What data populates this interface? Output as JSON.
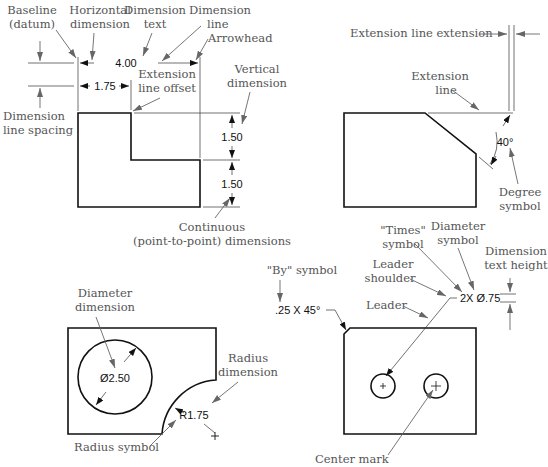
{
  "figure": {
    "panel_tl": {
      "labels": {
        "baseline": [
          "Baseline",
          "(datum)"
        ],
        "horizontal_dimension": [
          "Horizontal",
          "dimension"
        ],
        "dimension_text": [
          "Dimension",
          "text"
        ],
        "dimension_line": [
          "Dimension",
          "line"
        ],
        "arrowhead": "Arrowhead",
        "extension_line_offset": [
          "Extension",
          "line offset"
        ],
        "vertical_dimension": [
          "Vertical",
          "dimension"
        ],
        "dimension_line_spacing": [
          "Dimension",
          "line spacing"
        ],
        "continuous": [
          "Continuous",
          "(point-to-point) dimensions"
        ]
      },
      "dims": {
        "overall": "4.00",
        "partial": "1.75",
        "upper_v": "1.50",
        "lower_v": "1.50"
      }
    },
    "panel_tr": {
      "labels": {
        "ext_line_extension": "Extension line extension",
        "extension_line": [
          "Extension",
          "line"
        ],
        "degree_symbol": [
          "Degree",
          "symbol"
        ]
      },
      "dims": {
        "angle": "40°"
      }
    },
    "panel_bl": {
      "labels": {
        "diameter_dimension": [
          "Diameter",
          "dimension"
        ],
        "radius_dimension": [
          "Radius",
          "dimension"
        ],
        "radius_symbol": "Radius symbol"
      },
      "dims": {
        "diameter": "Ø2.50",
        "radius": "R1.75"
      }
    },
    "panel_br": {
      "labels": {
        "by_symbol": "\"By\" symbol",
        "times_symbol": [
          "\"Times\"",
          "symbol"
        ],
        "diameter_symbol": [
          "Diameter",
          "symbol"
        ],
        "dimension_text_height": [
          "Dimension",
          "text height"
        ],
        "leader_shoulder": [
          "Leader",
          "shoulder"
        ],
        "leader": "Leader",
        "center_mark": "Center mark"
      },
      "dims": {
        "chamfer": ".25 X 45°",
        "holes": "2X Ø.75"
      }
    }
  }
}
